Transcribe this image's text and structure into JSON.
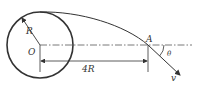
{
  "diagram": {
    "labels": {
      "radius": "R",
      "center": "O",
      "point": "A",
      "distance": "4R",
      "angle": "θ",
      "velocity": "v"
    },
    "colors": {
      "stroke": "#333333",
      "background": "#ffffff"
    }
  }
}
